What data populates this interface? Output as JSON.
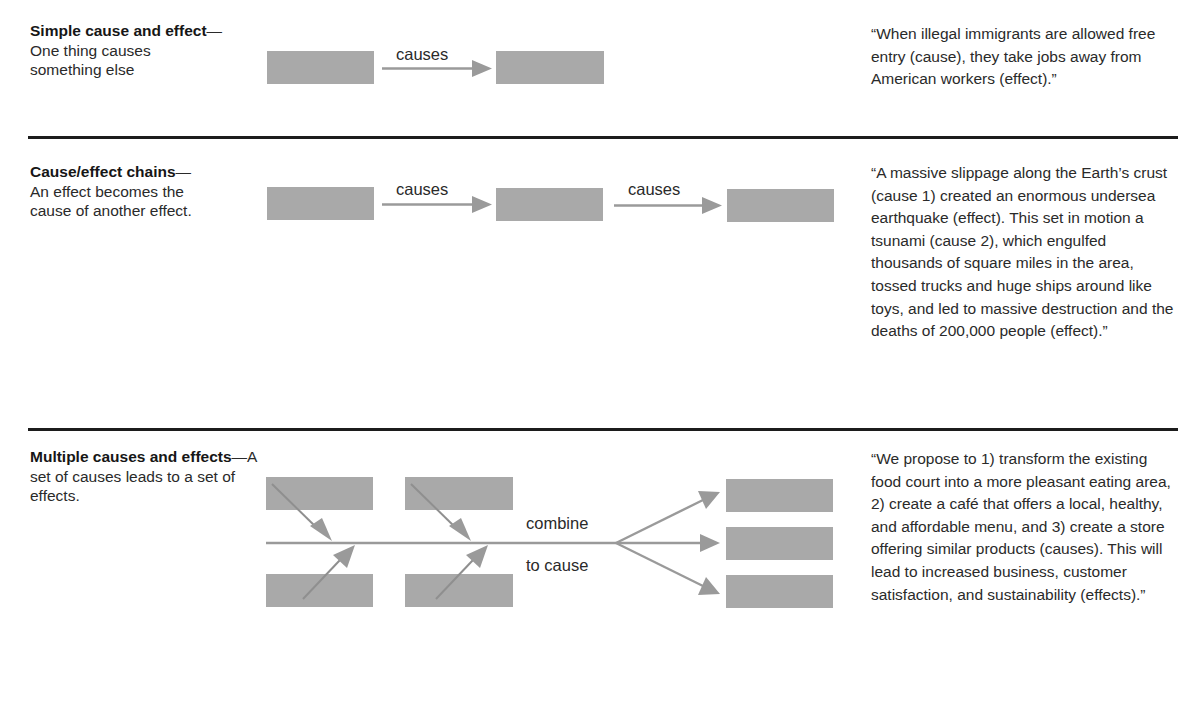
{
  "colors": {
    "box_fill": "#a9a9a9",
    "arrow": "#9a9a9a",
    "rule": "#1c1c1c",
    "text": "#2a2a2a"
  },
  "sections": [
    {
      "title": "Simple cause and effect",
      "dash": "—",
      "description": "One thing causes something else",
      "diagram": {
        "type": "linear",
        "boxes": 2,
        "arrow_labels": [
          "causes"
        ]
      },
      "example": "“When illegal immigrants are allowed free entry (cause), they take jobs away from American workers (effect).”"
    },
    {
      "title": "Cause/effect chains",
      "dash": "—",
      "description": "An effect becomes the cause of another effect.",
      "diagram": {
        "type": "chain",
        "boxes": 3,
        "arrow_labels": [
          "causes",
          "causes"
        ]
      },
      "example": "“A massive slippage along the Earth’s crust (cause 1) created an enormous undersea earthquake (effect). This set in motion a tsunami (cause 2), which engulfed thousands of  square miles in the area, tossed trucks and huge ships around like toys, and led to massive destruction and the deaths of 200,000 people (effect).”"
    },
    {
      "title": "Multiple causes and effects",
      "dash": "—",
      "description": "A set of causes leads to a set of effects.",
      "diagram": {
        "type": "fishbone",
        "cause_boxes": 4,
        "effect_boxes": 3,
        "label_top": "combine",
        "label_bottom": "to cause"
      },
      "example": "“We propose to 1) transform the existing food court into a more pleasant eating area, 2) create a café that offers a local, healthy, and affordable menu, and 3) create a store offering similar products (causes). This will lead to increased business, customer satisfaction, and sustainability (effects).”"
    }
  ]
}
